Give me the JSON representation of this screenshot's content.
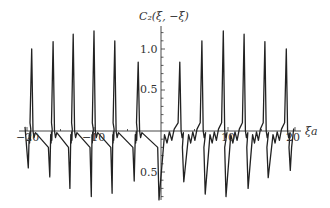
{
  "chart_data": {
    "type": "line",
    "title": "",
    "xlabel": "ξa",
    "ylabel": "C₂(ξ, −ξ)",
    "xlim": [
      -20.5,
      21
    ],
    "ylim": [
      -0.9,
      1.35
    ],
    "grid": false,
    "legend": null,
    "x_ticks": [
      {
        "value": -20,
        "label": "−20"
      },
      {
        "value": -10,
        "label": "−10"
      },
      {
        "value": 10,
        "label": "10"
      },
      {
        "value": 20,
        "label": "20"
      }
    ],
    "y_ticks": [
      {
        "value": 1.0,
        "label": "1.0"
      },
      {
        "value": 0.5,
        "label": "0.5"
      },
      {
        "value": -0.5,
        "label": "−0.5"
      }
    ],
    "series": [
      {
        "name": "C2(xi,-xi)",
        "peaks": [
          {
            "x": -19.3,
            "y": 1.0
          },
          {
            "x": -16.1,
            "y": 1.09
          },
          {
            "x": -13.1,
            "y": 1.18
          },
          {
            "x": -10.0,
            "y": 1.22
          },
          {
            "x": -6.9,
            "y": 1.1
          },
          {
            "x": -3.4,
            "y": 0.84
          },
          {
            "x": 2.8,
            "y": 0.84
          },
          {
            "x": 6.1,
            "y": 1.1
          },
          {
            "x": 9.3,
            "y": 1.22
          },
          {
            "x": 12.4,
            "y": 1.18
          },
          {
            "x": 15.5,
            "y": 1.09
          },
          {
            "x": 18.7,
            "y": 1.0
          }
        ],
        "troughs": [
          {
            "x": -19.8,
            "y": -0.45
          },
          {
            "x": -16.6,
            "y": -0.56
          },
          {
            "x": -13.6,
            "y": -0.7
          },
          {
            "x": -10.4,
            "y": -0.8
          },
          {
            "x": -7.3,
            "y": -0.76
          },
          {
            "x": -4.0,
            "y": -0.61
          },
          {
            "x": -0.3,
            "y": -0.84
          },
          {
            "x": 3.4,
            "y": -0.62
          },
          {
            "x": 6.6,
            "y": -0.77
          },
          {
            "x": 9.7,
            "y": -0.8
          },
          {
            "x": 13.0,
            "y": -0.7
          },
          {
            "x": 16.0,
            "y": -0.57
          },
          {
            "x": 19.3,
            "y": -0.48
          }
        ]
      }
    ]
  },
  "labels": {
    "y_axis_title": "C₂(ξ, −ξ)",
    "x_axis_title": "ξa",
    "x_tick_m20": "−20",
    "x_tick_m10": "−10",
    "x_tick_10": "10",
    "x_tick_20": "20",
    "y_tick_1": "1.0",
    "y_tick_05": "0.5",
    "y_tick_m05": "0.5"
  }
}
